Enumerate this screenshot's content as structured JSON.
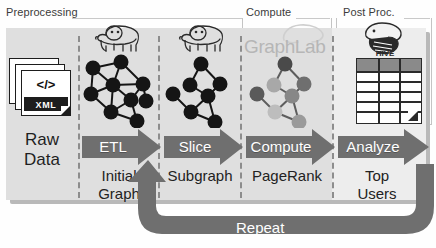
{
  "diagram": {
    "phases": [
      {
        "name": "preprocessing",
        "label": "Preprocessing"
      },
      {
        "name": "compute",
        "label": "Compute"
      },
      {
        "name": "post-proc",
        "label": "Post Proc."
      }
    ],
    "stages": [
      {
        "name": "raw-data",
        "caption_line1": "Raw",
        "caption_line2": "Data",
        "artifact": "xml-document-stack",
        "artifact_code": "</>",
        "artifact_label": "XML"
      },
      {
        "name": "initial-graph",
        "arrow_label": "ETL",
        "caption_line1": "Initial",
        "caption_line2": "Graph",
        "artifact": "hadoop-elephant-logo",
        "graph": "dense-black-graph"
      },
      {
        "name": "subgraph",
        "arrow_label": "Slice",
        "caption_line1": "Subgraph",
        "caption_line2": "",
        "artifact": "hadoop-elephant-logo",
        "graph": "sparse-black-graph"
      },
      {
        "name": "pagerank",
        "arrow_label": "Compute",
        "caption_line1": "PageRank",
        "caption_line2": "",
        "artifact": "graphlab-logo",
        "artifact_label": "GraphLab",
        "graph": "shaded-gray-graph"
      },
      {
        "name": "top-users",
        "arrow_label": "Analyze",
        "caption_line1": "Top",
        "caption_line2": "Users",
        "artifact": "apache-hive-logo",
        "artifact_label": "HIVE",
        "table": {
          "columns": 3,
          "header_rows": 1,
          "body_rows": 5
        }
      }
    ],
    "feedback": {
      "name": "repeat-loop",
      "label": "Repeat"
    },
    "colors": {
      "arrow_fill": "#6f6f6f",
      "arrow_text": "#ffffff",
      "panel_bg": "#dfdfdf",
      "panel_bg_light": "#ededed",
      "panel_shadow": "#b9b9b9",
      "node_dark": "#171717",
      "node_mid": "#7e7e7e",
      "node_light": "#b5b5b5",
      "table_header": "#8a8a8a",
      "graphlab_text": "#b6b6b6",
      "divider": "#8d8d8d"
    }
  }
}
